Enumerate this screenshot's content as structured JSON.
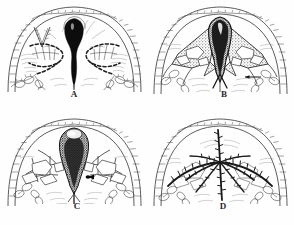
{
  "figure": {
    "kind": "scientific-line-drawing-plate",
    "background_color": "#ffffff",
    "ink_color": "#1a1a1a",
    "midtone_color": "#4a4a4a",
    "faint_color": "#8d8d8d",
    "grid": {
      "columns": 2,
      "rows": 2
    }
  },
  "panels": [
    {
      "id": "A",
      "label": "A",
      "position": "top-left",
      "caption": "Stage A",
      "central_structure": "solid black flask-shaped median body with tapering stalk",
      "lateral_structures": "bold dashed arcuate bands with lobed cells",
      "features": [
        "domed carapace margin with ladder hatching",
        "radiating fine striae around median body",
        "paired segmented appendage chains at lower flanks",
        "V-shaped notch mark upper left"
      ]
    },
    {
      "id": "B",
      "label": "B",
      "position": "top-right",
      "caption": "Stage B",
      "central_structure": "elongate dark stippled median column forking into a V below",
      "lateral_structures": "triangular shaded wings enclosing pale polygonal cells",
      "features": [
        "domed carapace margin with ladder hatching",
        "heavy stipple shading over wing panels",
        "horizontal arrow-like pointer at right",
        "segmented appendage chains at lower flanks"
      ]
    },
    {
      "id": "C",
      "label": "C",
      "position": "bottom-left",
      "caption": "Stage C",
      "central_structure": "dense coarsely stippled ovoid median mass with descending stalk",
      "lateral_structures": "pale polygonal cells framed by thin dark struts",
      "features": [
        "domed carapace margin with ladder hatching",
        "small solid black spot on right of median mass",
        "branching appendage chains at lower flanks"
      ]
    },
    {
      "id": "D",
      "label": "D",
      "position": "bottom-right",
      "caption": "Stage D",
      "central_structure": "bold dark branching median line with short barb ticks",
      "lateral_structures": "bold arched branches bearing perpendicular barbs and open cells",
      "features": [
        "domed carapace margin with ladder hatching",
        "no stippled median mass",
        "radiating barbed rays from a central junction"
      ]
    }
  ]
}
